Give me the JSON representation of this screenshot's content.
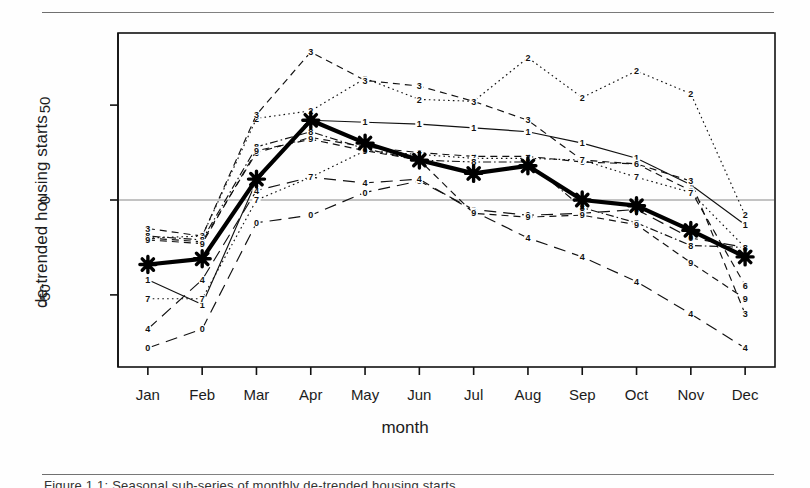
{
  "figure": {
    "caption_partial": "Figure 1.1:  Seasonal sub-series of monthly de-trended housing starts",
    "rule_top": "horizontal-rule",
    "rule_bottom": "horizontal-rule"
  },
  "chart_data": {
    "type": "line",
    "title": "",
    "subtitle": "",
    "xlabel": "month",
    "ylabel": "de-trended housing starts",
    "categories": [
      "Jan",
      "Feb",
      "Mar",
      "Apr",
      "May",
      "Jun",
      "Jul",
      "Aug",
      "Sep",
      "Oct",
      "Nov",
      "Dec"
    ],
    "xtick_labels": [
      "Jan",
      "Feb",
      "Mar",
      "Apr",
      "May",
      "Jun",
      "Jul",
      "Aug",
      "Sep",
      "Oct",
      "Nov",
      "Dec"
    ],
    "ytick_labels": [
      "50",
      "0",
      "-50"
    ],
    "ytick_values": [
      50,
      0,
      -50
    ],
    "ylim": [
      -88,
      88
    ],
    "xlim": [
      0.45,
      12.55
    ],
    "grid": false,
    "zero_line": true,
    "legend": "none",
    "point_marker": "digit-label",
    "series": [
      {
        "name": "0",
        "label": "0",
        "style": "longdash",
        "values": [
          -78,
          -68,
          -12,
          -8,
          4,
          10,
          -5,
          -8,
          -7,
          -5,
          -20,
          -25
        ]
      },
      {
        "name": "1",
        "label": "1",
        "style": "solid",
        "values": [
          -42,
          -55,
          10,
          42,
          41,
          40,
          38,
          36,
          30,
          22,
          8,
          -13
        ]
      },
      {
        "name": "2",
        "label": "2",
        "style": "dotted",
        "values": [
          -20,
          -19,
          43,
          47,
          64,
          53,
          52,
          75,
          54,
          68,
          56,
          -8
        ]
      },
      {
        "name": "3",
        "label": "3",
        "style": "dashed",
        "values": [
          -15,
          -19,
          45,
          78,
          63,
          60,
          52,
          42,
          21,
          19,
          10,
          -60
        ]
      },
      {
        "name": "4",
        "label": "4",
        "style": "longdash",
        "values": [
          -68,
          -42,
          5,
          12,
          9,
          11,
          -6,
          -20,
          -30,
          -43,
          -60,
          -78
        ]
      },
      {
        "name": "6",
        "label": "6",
        "style": "dashed",
        "values": [
          -20,
          -22,
          25,
          33,
          28,
          25,
          23,
          23,
          20,
          19,
          5,
          -45
        ]
      },
      {
        "name": "7",
        "label": "7",
        "style": "dotted",
        "values": [
          -52,
          -52,
          0,
          12,
          26,
          24,
          22,
          22,
          21,
          12,
          4,
          -25
        ]
      },
      {
        "name": "8",
        "label": "8",
        "style": "dotdash",
        "values": [
          -19,
          -21,
          28,
          36,
          27,
          21,
          20,
          20,
          -4,
          -12,
          -24,
          -25
        ]
      },
      {
        "name": "9",
        "label": "9",
        "style": "dashed",
        "values": [
          -21,
          -23,
          26,
          32,
          26,
          21,
          -7,
          -9,
          -8,
          -13,
          -33,
          -52
        ]
      }
    ],
    "mean_series": {
      "name": "mean",
      "label": "mean",
      "style": "thick-solid-with-star-markers",
      "marker": "star",
      "values": [
        -34,
        -31,
        11,
        42,
        30,
        21,
        14,
        18,
        0,
        -3,
        -16,
        -30
      ]
    },
    "point_labels": {
      "Jan": [
        "3",
        "2",
        "8",
        "6",
        "9",
        "1",
        "7",
        "4",
        "0"
      ],
      "Feb": [
        "2",
        "3",
        "6",
        "9",
        "8",
        "4",
        "7",
        "1",
        "0"
      ],
      "Mar": [
        "3",
        "2",
        "6",
        "8",
        "9",
        "1",
        "4",
        "7",
        "0"
      ],
      "Apr": [
        "3",
        "2",
        "1",
        "6",
        "8",
        "9",
        "7",
        "4",
        "0"
      ],
      "May": [
        "3",
        "2",
        "1",
        "6",
        "7",
        "8",
        "9",
        "4",
        "0"
      ],
      "Jun": [
        "3",
        "2",
        "1",
        "6",
        "7",
        "8",
        "9",
        "4",
        "0"
      ],
      "Jul": [
        "2",
        "3",
        "1",
        "6",
        "7",
        "8",
        "9",
        "4",
        "0"
      ],
      "Aug": [
        "2",
        "3",
        "1",
        "6",
        "7",
        "8",
        "9",
        "4",
        "0"
      ],
      "Sep": [
        "2",
        "3",
        "1",
        "6",
        "7",
        "8",
        "9",
        "4",
        "0"
      ],
      "Oct": [
        "2",
        "3",
        "1",
        "6",
        "7",
        "8",
        "9",
        "4",
        "0"
      ],
      "Nov": [
        "2",
        "6",
        "1",
        "8",
        "9",
        "4",
        "3",
        "0",
        "7"
      ],
      "Dec": [
        "2",
        "1",
        "8",
        "6",
        "9",
        "3",
        "4",
        "0",
        "7"
      ]
    }
  }
}
